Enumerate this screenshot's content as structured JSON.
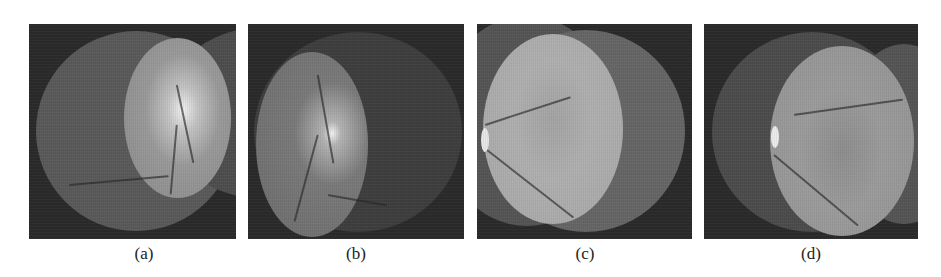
{
  "figure": {
    "panels": [
      {
        "id": "a",
        "label": "(a)",
        "description": "Two overlapping fundus images, right one brighter with optic disc"
      },
      {
        "id": "b",
        "label": "(b)",
        "description": "Two overlapping fundus images, left one brighter with optic disc"
      },
      {
        "id": "c",
        "label": "(c)",
        "description": "Two overlapping fundus images, left one brighter showing macula"
      },
      {
        "id": "d",
        "label": "(d)",
        "description": "Two overlapping fundus images, right one brighter showing macula"
      }
    ]
  }
}
